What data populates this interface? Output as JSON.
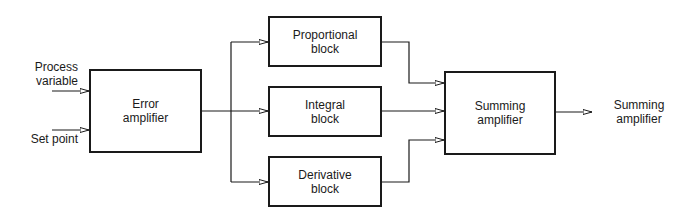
{
  "diagram": {
    "type": "PID controller block diagram",
    "inputs": [
      {
        "id": "process-variable",
        "line1": "Process",
        "line2": "variable"
      },
      {
        "id": "set-point",
        "line1": "Set point"
      }
    ],
    "blocks": {
      "error_amplifier": {
        "line1": "Error",
        "line2": "amplifier"
      },
      "proportional": {
        "line1": "Proportional",
        "line2": "block"
      },
      "integral": {
        "line1": "Integral",
        "line2": "block"
      },
      "derivative": {
        "line1": "Derivative",
        "line2": "block"
      },
      "summing_amplifier": {
        "line1": "Summing",
        "line2": "amplifier"
      }
    },
    "output": {
      "line1": "Summing",
      "line2": "amplifier"
    },
    "connections": [
      [
        "Process variable",
        "Error amplifier"
      ],
      [
        "Set point",
        "Error amplifier"
      ],
      [
        "Error amplifier",
        "Proportional block"
      ],
      [
        "Error amplifier",
        "Integral block"
      ],
      [
        "Error amplifier",
        "Derivative block"
      ],
      [
        "Proportional block",
        "Summing amplifier"
      ],
      [
        "Integral block",
        "Summing amplifier"
      ],
      [
        "Derivative block",
        "Summing amplifier"
      ],
      [
        "Summing amplifier",
        "Summing amplifier (output)"
      ]
    ],
    "colors": {
      "line": "#1a1a1a",
      "background": "#ffffff"
    }
  }
}
